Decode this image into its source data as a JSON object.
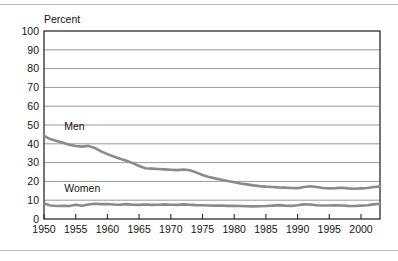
{
  "page": {
    "background_color": "#ffffff",
    "rule_color": "#b9b9b9",
    "top_rule": true,
    "bottom_rule": true
  },
  "axis_title": "Percent",
  "chart_data": {
    "type": "line",
    "title": "",
    "subtitle": "",
    "xlabel": "",
    "ylabel": "Percent",
    "ylim": [
      0,
      100
    ],
    "xlim": [
      1950,
      2003
    ],
    "ytick_labels": [
      "0",
      "10",
      "20",
      "30",
      "40",
      "50",
      "60",
      "70",
      "80",
      "90",
      "100"
    ],
    "ytick_values": [
      0,
      10,
      20,
      30,
      40,
      50,
      60,
      70,
      80,
      90,
      100
    ],
    "xtick_labels": [
      "1950",
      "1955",
      "1960",
      "1965",
      "1970",
      "1975",
      "1980",
      "1985",
      "1990",
      "1995",
      "2000"
    ],
    "xtick_values": [
      1950,
      1955,
      1960,
      1965,
      1970,
      1975,
      1980,
      1985,
      1990,
      1995,
      2000
    ],
    "grid": true,
    "grid_axis": "y",
    "legend_position": "inline-annotation",
    "line_color": "#8a8a8a",
    "frame_color": "#2b2b2b",
    "annotations": [
      {
        "text": "Men",
        "x": 1953.2,
        "y": 47.5
      },
      {
        "text": "Women",
        "x": 1953.2,
        "y": 14.5
      }
    ],
    "x": [
      1950,
      1951,
      1952,
      1953,
      1954,
      1955,
      1956,
      1957,
      1958,
      1959,
      1960,
      1961,
      1962,
      1963,
      1964,
      1965,
      1966,
      1967,
      1968,
      1969,
      1970,
      1971,
      1972,
      1973,
      1974,
      1975,
      1976,
      1977,
      1978,
      1979,
      1980,
      1981,
      1982,
      1983,
      1984,
      1985,
      1986,
      1987,
      1988,
      1989,
      1990,
      1991,
      1992,
      1993,
      1994,
      1995,
      1996,
      1997,
      1998,
      1999,
      2000,
      2001,
      2002,
      2003
    ],
    "series": [
      {
        "name": "Men",
        "label": "Men",
        "color": "#8a8a8a",
        "values": [
          44.2,
          42.5,
          41.5,
          40.5,
          39.5,
          38.8,
          38.5,
          38.9,
          37.8,
          36.0,
          34.5,
          33.2,
          32.0,
          31.0,
          29.7,
          28.2,
          27.0,
          26.8,
          26.6,
          26.4,
          26.2,
          26.0,
          26.3,
          25.9,
          24.8,
          23.4,
          22.3,
          21.6,
          20.9,
          20.2,
          19.5,
          18.9,
          18.4,
          17.9,
          17.5,
          17.2,
          17.0,
          16.8,
          16.7,
          16.5,
          16.4,
          17.0,
          17.4,
          17.0,
          16.5,
          16.3,
          16.4,
          16.6,
          16.3,
          16.1,
          16.3,
          16.5,
          17.0,
          17.2
        ]
      },
      {
        "name": "Women",
        "label": "Women",
        "color": "#8a8a8a",
        "values": [
          8.2,
          7.2,
          6.9,
          7.0,
          6.9,
          7.6,
          7.0,
          7.7,
          8.1,
          7.9,
          8.0,
          7.7,
          7.6,
          7.9,
          7.6,
          7.5,
          7.7,
          7.5,
          7.6,
          7.8,
          7.6,
          7.5,
          7.8,
          7.6,
          7.4,
          7.3,
          7.2,
          7.1,
          7.1,
          7.0,
          7.0,
          6.9,
          6.8,
          6.7,
          6.8,
          6.9,
          7.1,
          7.4,
          7.1,
          7.0,
          7.3,
          7.8,
          7.7,
          7.3,
          7.2,
          7.2,
          7.3,
          7.2,
          7.0,
          6.9,
          7.1,
          7.3,
          7.8,
          8.1
        ]
      }
    ]
  }
}
